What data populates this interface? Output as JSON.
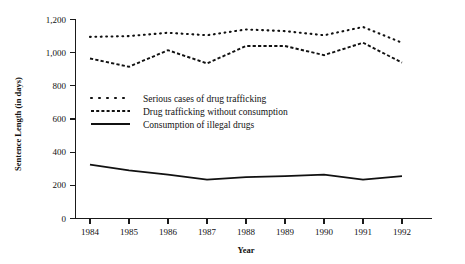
{
  "chart_data": {
    "type": "line",
    "title": "",
    "xlabel": "Year",
    "ylabel": "Sentence Length (in days)",
    "categories": [
      "1984",
      "1985",
      "1986",
      "1987",
      "1988",
      "1989",
      "1990",
      "1991",
      "1992"
    ],
    "x": [
      1984,
      1985,
      1986,
      1987,
      1988,
      1989,
      1990,
      1991,
      1992
    ],
    "xlim": [
      1984,
      1992
    ],
    "ylim": [
      0,
      1200
    ],
    "y_ticks": [
      "0",
      "200",
      "400",
      "600",
      "800",
      "1,000",
      "1,200"
    ],
    "y_tick_values": [
      0,
      200,
      400,
      600,
      800,
      1000,
      1200
    ],
    "grid": false,
    "legend_position": "center-left-inside",
    "series": [
      {
        "name": "Serious cases of drug trafficking",
        "style": "dotted",
        "values": [
          1095,
          1100,
          1120,
          1105,
          1140,
          1130,
          1105,
          1155,
          1060
        ]
      },
      {
        "name": "Drug trafficking without consumption",
        "style": "dashed",
        "values": [
          965,
          915,
          1015,
          935,
          1040,
          1040,
          985,
          1060,
          940
        ]
      },
      {
        "name": "Consumption of illegal drugs",
        "style": "solid",
        "values": [
          325,
          290,
          265,
          235,
          250,
          255,
          265,
          235,
          255
        ]
      }
    ]
  },
  "axes": {
    "y_title": "Sentence Length (in days)",
    "x_title": "Year"
  },
  "legend": {
    "items": [
      {
        "label": "Serious cases of drug trafficking",
        "marker": "dotted-line-marker"
      },
      {
        "label": "Drug trafficking without consumption",
        "marker": "dashed-line-marker"
      },
      {
        "label": "Consumption of illegal drugs",
        "marker": "solid-line-marker"
      }
    ]
  },
  "colors": {
    "ink": "#111111",
    "background": "#ffffff"
  }
}
